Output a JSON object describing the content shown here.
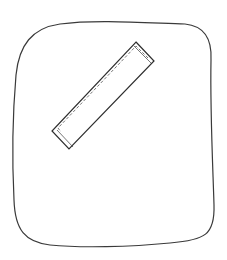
{
  "drawing": {
    "background": "#ffffff",
    "stroke_color": "#3a3a3a",
    "outline": {
      "shape": "hand-drawn rounded square",
      "bounds": {
        "x_min": 13,
        "x_max": 215,
        "y_min": 20,
        "y_max": 247
      }
    },
    "strip": {
      "shape": "tilted rectangle with dashed inner line",
      "corners": [
        [
          136,
          42
        ],
        [
          154,
          61
        ],
        [
          69,
          149
        ],
        [
          52,
          131
        ]
      ]
    }
  }
}
